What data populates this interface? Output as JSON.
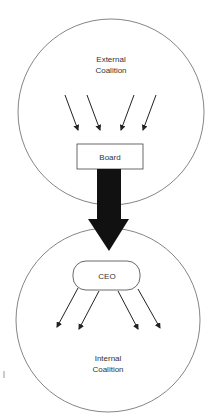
{
  "diagram": {
    "external_circle": {
      "label_line1": "External",
      "label_line2": "Coalition"
    },
    "board_box": {
      "label": "Board"
    },
    "ceo_node": {
      "label": "CEO"
    },
    "internal_circle": {
      "label_line1": "Internal",
      "label_line2": "Coalition"
    },
    "influence_arrows_in": 4,
    "influence_arrows_out": 4,
    "colors": {
      "stroke": "#555555",
      "arrow": "#111111",
      "background": "#ffffff"
    }
  }
}
